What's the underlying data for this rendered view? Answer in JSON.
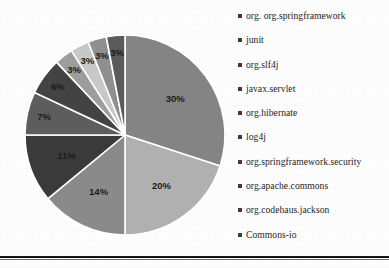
{
  "chart_data": {
    "type": "pie",
    "title": "",
    "subtitle": "",
    "xlabel": "",
    "ylabel": "",
    "legend_position": "right",
    "grid": false,
    "unit": "%",
    "categories": [
      "org. org.springframework",
      "junit",
      "org.slf4j",
      "javax.servlet",
      "org.hibernate",
      "log4j",
      "org.springframework.security",
      "org.apache.commons",
      "org.codehaus.jackson",
      "Commons-io"
    ],
    "values": [
      30,
      20,
      14,
      11,
      7,
      6,
      3,
      3,
      3,
      3
    ],
    "data_labels": [
      "30%",
      "20%",
      "14%",
      "11%",
      "7%",
      "6%",
      "3%",
      "3%",
      "3%",
      "3%"
    ],
    "colors": [
      "#848484",
      "#b0b0b0",
      "#8a8a8a",
      "#3a3a3a",
      "#5d5d5d",
      "#434343",
      "#9d9d9d",
      "#c8c8c8",
      "#8f8f8f",
      "#5a5a5a"
    ]
  },
  "legend": {
    "items": [
      {
        "label": "org. org.springframework",
        "color": "#848484"
      },
      {
        "label": "junit",
        "color": "#b0b0b0"
      },
      {
        "label": "org.slf4j",
        "color": "#8a8a8a"
      },
      {
        "label": "javax.servlet",
        "color": "#3a3a3a"
      },
      {
        "label": "org.hibernate",
        "color": "#5d5d5d"
      },
      {
        "label": "log4j",
        "color": "#434343"
      },
      {
        "label": "org.springframework.security",
        "color": "#9d9d9d"
      },
      {
        "label": "org.apache.commons",
        "color": "#c8c8c8"
      },
      {
        "label": "org.codehaus.jackson",
        "color": "#8f8f8f"
      },
      {
        "label": "Commons-io",
        "color": "#5a5a5a"
      }
    ]
  },
  "geometry": {
    "center_x": 115,
    "center_y": 113,
    "radius": 100
  }
}
